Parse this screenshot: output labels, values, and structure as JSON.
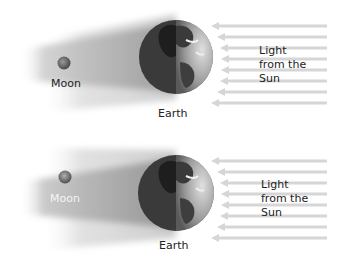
{
  "diagrams": [
    {
      "id": "top",
      "labels": {
        "moon": "Moon",
        "earth": "Earth",
        "light": "Light\nfrom the\nSun"
      }
    },
    {
      "id": "bottom",
      "labels": {
        "moon": "Moon",
        "earth": "Earth",
        "light": "Light\nfrom the\nSun"
      }
    }
  ],
  "colors": {
    "shadow": "#9a9a9a",
    "arrow": "#d4d4d4",
    "earth_dark": "#4a4a4a",
    "earth_light": "#b5b5b5",
    "moon": "#6e6e6e"
  },
  "arrows_per_diagram": 8
}
